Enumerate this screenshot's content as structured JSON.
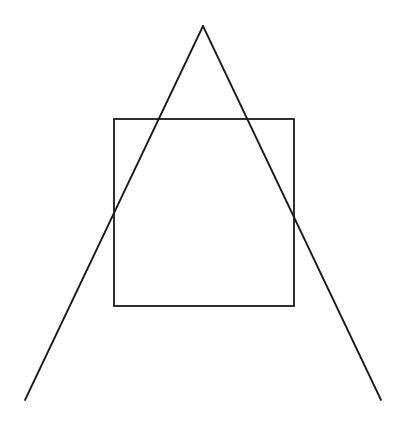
{
  "diagram": {
    "stroke_color": "#1a1a1a",
    "background_color": "#ffffff",
    "canvas": {
      "width": 406,
      "height": 425
    },
    "triangle": {
      "apex": {
        "x": 203,
        "y": 26
      },
      "left_end": {
        "x": 25,
        "y": 400
      },
      "right_end": {
        "x": 381,
        "y": 400
      },
      "base_drawn": false
    },
    "square": {
      "x": 114,
      "y": 119,
      "width": 180,
      "height": 187
    }
  }
}
